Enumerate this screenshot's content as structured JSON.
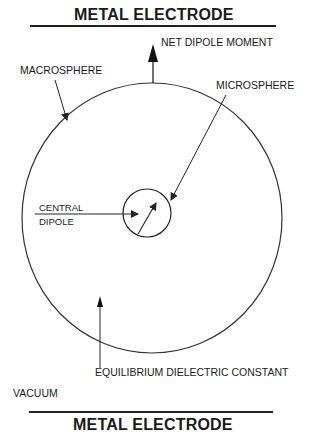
{
  "top_electrode": {
    "label": "METAL ELECTRODE"
  },
  "bottom_electrode": {
    "label": "METAL ELECTRODE"
  },
  "labels": {
    "net_dipole_moment": "NET DIPOLE MOMENT",
    "macrosphere": "MACROSPHERE",
    "microsphere": "MICROSPHERE",
    "central_dipole_line1": "CENTRAL",
    "central_dipole_line2": "DIPOLE",
    "equilibrium_dielectric_constant": "EQUILIBRIUM DIELECTRIC CONSTANT",
    "vacuum": "VACUUM"
  },
  "colors": {
    "ink": "#222222",
    "background": "#ffffff"
  }
}
